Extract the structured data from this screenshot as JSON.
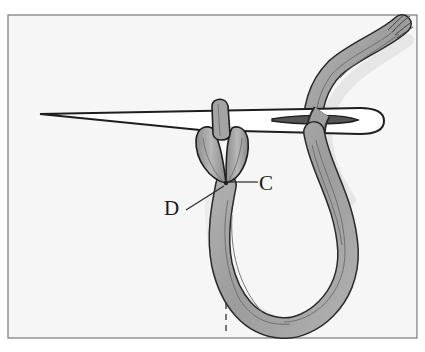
{
  "figure": {
    "labels": {
      "c": "C",
      "d": "D"
    },
    "colors": {
      "background": "#ffffff",
      "panel": "#f6f6f6",
      "frame": "#7a7a7a",
      "thread": "#9a9a9a",
      "thread_dark": "#6e6e6e",
      "outline": "#2a2a2a",
      "needle": "#ffffff"
    }
  }
}
